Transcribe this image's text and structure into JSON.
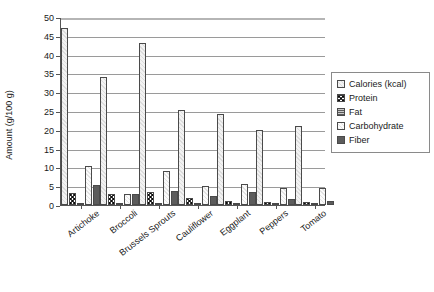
{
  "chart_data": {
    "type": "bar",
    "title": "",
    "xlabel": "",
    "ylabel": "Amount (g/100 g)",
    "ylim": [
      0,
      50
    ],
    "ytick_step": 5,
    "yticks": [
      "0",
      "5",
      "10",
      "15",
      "20",
      "25",
      "30",
      "35",
      "40",
      "45",
      "50"
    ],
    "grid": true,
    "legend_position": "right",
    "categories": [
      "Artichoke",
      "Broccoli",
      "Brussels Sprouts",
      "Cauliflower",
      "Eggplant",
      "Peppers",
      "Tomato"
    ],
    "series": [
      {
        "name": "Calories (kcal)",
        "pattern": "light-dotted",
        "values": [
          47,
          34,
          43,
          25.3,
          24.2,
          20,
          21
        ]
      },
      {
        "name": "Protein",
        "pattern": "cross-hatch",
        "values": [
          3.3,
          2.8,
          3.4,
          1.9,
          1.0,
          0.9,
          0.9
        ]
      },
      {
        "name": "Fat",
        "pattern": "fine-lines",
        "values": [
          0.2,
          0.4,
          0.3,
          0.3,
          0.2,
          0.2,
          0.2
        ]
      },
      {
        "name": "Carbohydrate",
        "pattern": "very-light",
        "values": [
          10.5,
          3.0,
          9.0,
          5.0,
          5.7,
          4.6,
          4.6
        ]
      },
      {
        "name": "Fiber",
        "pattern": "solid-dark",
        "values": [
          5.4,
          3.0,
          3.8,
          2.5,
          3.4,
          1.7,
          1.2
        ]
      }
    ],
    "colors": {
      "series_calories": "#f2f2f2",
      "series_protein": "#3a3a3a",
      "series_fat": "#8e8e8e",
      "series_carbohydrate": "#fbfbfb",
      "series_fiber": "#5c5c5c",
      "axis": "#555555",
      "gridline": "#9a9a9a",
      "background": "#ffffff"
    }
  }
}
